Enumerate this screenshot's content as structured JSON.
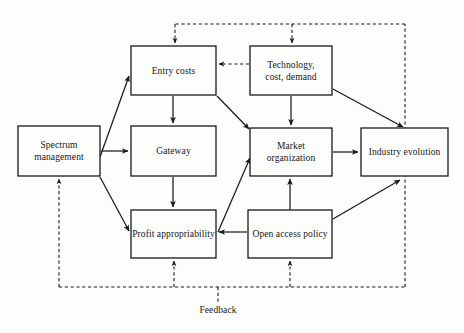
{
  "diagram": {
    "background_color": "#fdfdfc",
    "line_color": "#1a1a1a",
    "text_color": "#16161a",
    "nodes": [
      {
        "id": "spectrum-management",
        "label": "Spectrum\nmanagement",
        "line1": "Spectrum",
        "line2": "management",
        "x": 18,
        "y": 126,
        "w": 82,
        "h": 50
      },
      {
        "id": "entry-costs",
        "label": "Entry costs",
        "line1": "Entry costs",
        "line2": "",
        "x": 131,
        "y": 46,
        "w": 85,
        "h": 49
      },
      {
        "id": "gateway",
        "label": "Gateway",
        "line1": "Gateway",
        "line2": "",
        "x": 131,
        "y": 126,
        "w": 85,
        "h": 50
      },
      {
        "id": "profit-appropriability",
        "label": "Profit appropriability",
        "line1": "Profit appropriability",
        "line2": "",
        "x": 131,
        "y": 210,
        "w": 85,
        "h": 48
      },
      {
        "id": "technology-cost-demand",
        "label": "Technology,\ncost, demand",
        "line1": "Technology,",
        "line2": "cost, demand",
        "x": 250,
        "y": 46,
        "w": 82,
        "h": 49
      },
      {
        "id": "market-organization",
        "label": "Market\norganization",
        "line1": "Market",
        "line2": "organization",
        "x": 250,
        "y": 128,
        "w": 82,
        "h": 48
      },
      {
        "id": "open-access-policy",
        "label": "Open access policy",
        "line1": "Open access policy",
        "line2": "",
        "x": 248,
        "y": 210,
        "w": 84,
        "h": 48
      },
      {
        "id": "industry-evolution",
        "label": "Industry evolution",
        "line1": "Industry evolution",
        "line2": "",
        "x": 361,
        "y": 128,
        "w": 87,
        "h": 48
      }
    ],
    "annotations": [
      {
        "id": "feedback-label",
        "text": "Feedback",
        "x": 218,
        "y": 311
      }
    ],
    "edges": [
      {
        "id": "spectrum-to-gateway",
        "from": "spectrum-management",
        "to": "gateway",
        "style": "solid"
      },
      {
        "id": "spectrum-to-entry-costs",
        "from": "spectrum-management",
        "to": "entry-costs",
        "style": "solid"
      },
      {
        "id": "spectrum-to-profit-appropriability",
        "from": "spectrum-management",
        "to": "profit-appropriability",
        "style": "solid"
      },
      {
        "id": "entry-costs-to-gateway",
        "from": "entry-costs",
        "to": "gateway",
        "style": "solid"
      },
      {
        "id": "entry-costs-to-market-organization",
        "from": "entry-costs",
        "to": "market-organization",
        "style": "solid"
      },
      {
        "id": "gateway-to-profit-appropriability",
        "from": "gateway",
        "to": "profit-appropriability",
        "style": "solid"
      },
      {
        "id": "technology-to-entry-costs",
        "from": "technology-cost-demand",
        "to": "entry-costs",
        "style": "dashed"
      },
      {
        "id": "technology-to-market-organization",
        "from": "technology-cost-demand",
        "to": "market-organization",
        "style": "solid"
      },
      {
        "id": "technology-to-industry-evolution",
        "from": "technology-cost-demand",
        "to": "industry-evolution",
        "style": "solid"
      },
      {
        "id": "profit-appropriability-to-market-organization",
        "from": "profit-appropriability",
        "to": "market-organization",
        "style": "solid"
      },
      {
        "id": "market-organization-to-industry-evolution",
        "from": "market-organization",
        "to": "industry-evolution",
        "style": "solid"
      },
      {
        "id": "open-access-to-market-organization",
        "from": "open-access-policy",
        "to": "market-organization",
        "style": "solid"
      },
      {
        "id": "open-access-to-profit-appropriability",
        "from": "open-access-policy",
        "to": "profit-appropriability",
        "style": "solid"
      },
      {
        "id": "open-access-to-industry-evolution",
        "from": "open-access-policy",
        "to": "industry-evolution",
        "style": "solid"
      },
      {
        "id": "feedback-to-entry-costs",
        "from": "feedback-bus",
        "to": "entry-costs",
        "style": "dashed"
      },
      {
        "id": "feedback-to-technology",
        "from": "feedback-bus",
        "to": "technology-cost-demand",
        "style": "dashed"
      },
      {
        "id": "feedback-to-spectrum-management",
        "from": "feedback-bus",
        "to": "spectrum-management",
        "style": "dashed"
      },
      {
        "id": "feedback-to-profit-appropriability",
        "from": "feedback-bus",
        "to": "profit-appropriability",
        "style": "dashed"
      },
      {
        "id": "feedback-to-open-access-policy",
        "from": "feedback-bus",
        "to": "open-access-policy",
        "style": "dashed"
      }
    ]
  }
}
